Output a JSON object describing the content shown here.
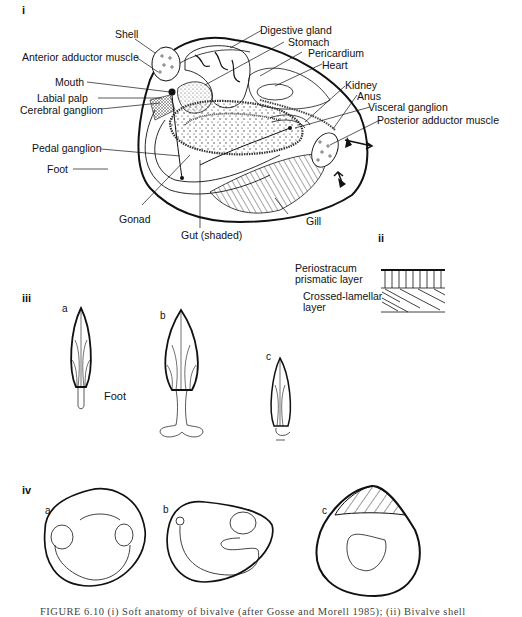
{
  "figure": {
    "panels": {
      "i": "i",
      "ii": "ii",
      "iii": "iii",
      "iv": "iv"
    },
    "panel_i_labels": {
      "shell": "Shell",
      "anterior_adductor": "Anterior adductor muscle",
      "mouth": "Mouth",
      "labial_palp": "Labial palp",
      "cerebral_ganglion": "Cerebral ganglion",
      "pedal_ganglion": "Pedal ganglion",
      "foot": "Foot",
      "gonad": "Gonad",
      "gut": "Gut (shaded)",
      "gill": "Gill",
      "digestive_gland": "Digestive gland",
      "stomach": "Stomach",
      "pericardium": "Pericardium",
      "heart": "Heart",
      "kidney": "Kidney",
      "anus": "Anus",
      "visceral_ganglion": "Visceral ganglion",
      "posterior_adductor": "Posterior adductor muscle"
    },
    "panel_ii_labels": {
      "periostracum": "Periostracum",
      "prismatic": "prismatic layer",
      "crossed_lamellar": "Crossed-lamellar",
      "layer": "layer"
    },
    "panel_iii_labels": {
      "a": "a",
      "b": "b",
      "c": "c",
      "foot": "Foot"
    },
    "panel_iv_labels": {
      "a": "a",
      "b": "b",
      "c": "c"
    },
    "caption": "FIGURE 6.10 (i) Soft anatomy of bivalve (after Gosse and Morell 1985); (ii) Bivalve shell"
  }
}
